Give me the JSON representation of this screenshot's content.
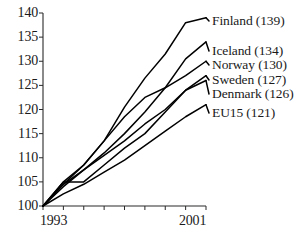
{
  "chart_data": {
    "type": "line",
    "title": "",
    "subtitle": "",
    "xlabel": "",
    "ylabel": "",
    "xlim": [
      1993,
      2001
    ],
    "ylim": [
      100,
      140
    ],
    "x": [
      1993,
      1994,
      1995,
      1996,
      1997,
      1998,
      1999,
      2000,
      2001
    ],
    "x_ticks": [
      1993,
      1994,
      1995,
      1996,
      1997,
      1998,
      1999,
      2000,
      2001
    ],
    "x_tick_labels": [
      "1993",
      "",
      "",
      "",
      "",
      "",
      "",
      "",
      "2001"
    ],
    "y_ticks": [
      100,
      105,
      110,
      115,
      120,
      125,
      130,
      135,
      140
    ],
    "y_tick_labels": [
      "100",
      "105",
      "110",
      "115",
      "120",
      "125",
      "130",
      "135",
      "140"
    ],
    "grid": false,
    "legend_position": "right-inline-end-of-line",
    "index_base_year": 1993,
    "index_base_value": 100,
    "series": [
      {
        "name": "Finland",
        "label": "Finland (139)",
        "end_value": 139,
        "color": "#000000",
        "values": [
          100,
          104.5,
          108.5,
          113.5,
          120.5,
          126.5,
          131.5,
          138.0,
          139.0
        ]
      },
      {
        "name": "Iceland",
        "label": "Iceland (134)",
        "end_value": 134,
        "color": "#000000",
        "values": [
          100,
          104.0,
          107.5,
          111.0,
          115.0,
          119.5,
          124.5,
          130.5,
          134.0
        ]
      },
      {
        "name": "Norway",
        "label": "Norway (130)",
        "end_value": 130,
        "color": "#000000",
        "values": [
          100,
          105.0,
          108.5,
          113.5,
          118.5,
          122.5,
          124.5,
          127.0,
          130.0
        ]
      },
      {
        "name": "Sweden",
        "label": "Sweden (127)",
        "end_value": 127,
        "color": "#000000",
        "values": [
          100,
          104.5,
          107.5,
          110.5,
          113.5,
          117.0,
          120.0,
          124.0,
          127.0
        ]
      },
      {
        "name": "Denmark",
        "label": "Denmark (126)",
        "end_value": 126,
        "color": "#000000",
        "values": [
          100,
          105.0,
          105.0,
          108.5,
          112.0,
          115.0,
          119.5,
          124.0,
          126.0
        ]
      },
      {
        "name": "EU15",
        "label": "EU15 (121)",
        "end_value": 121,
        "color": "#000000",
        "values": [
          100,
          102.5,
          104.5,
          107.0,
          109.5,
          112.5,
          115.5,
          118.5,
          121.0
        ]
      }
    ]
  },
  "labels": {
    "series_labels": [
      "Finland (139)",
      "Iceland (134)",
      "Norway (130)",
      "Sweden (127)",
      "Denmark (126)",
      "EU15 (121)"
    ],
    "y_axis": [
      "140",
      "135",
      "130",
      "125",
      "120",
      "115",
      "110",
      "105",
      "100"
    ],
    "x_axis_start": "1993",
    "x_axis_end": "2001"
  }
}
